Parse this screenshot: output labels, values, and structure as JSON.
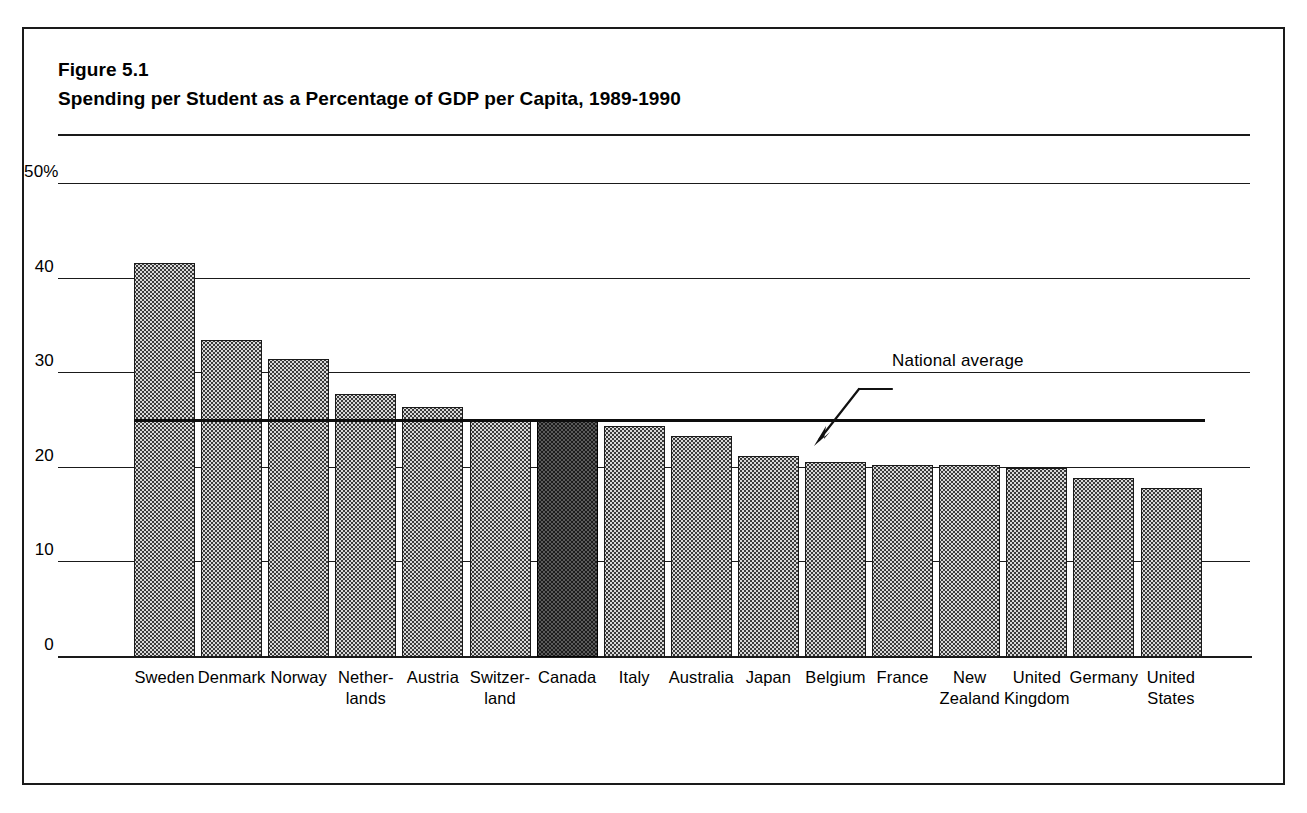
{
  "figure": {
    "number": "Figure 5.1",
    "title": "Spending per Student as a Percentage of GDP per Capita, 1989-1990"
  },
  "annotation": {
    "label": "National average"
  },
  "chart_data": {
    "type": "bar",
    "title": "Spending per Student as a Percentage of GDP per Capita, 1989-1990",
    "xlabel": "",
    "ylabel": "",
    "ylim": [
      0,
      50
    ],
    "yticks": [
      "0",
      "10",
      "20",
      "30",
      "40",
      "50%"
    ],
    "ytick_values": [
      0,
      10,
      20,
      30,
      40,
      50
    ],
    "grid": true,
    "legend": false,
    "categories": [
      "Sweden",
      "Denmark",
      "Norway",
      "Nether-\nlands",
      "Austria",
      "Switzer-\nland",
      "Canada",
      "Italy",
      "Australia",
      "Japan",
      "Belgium",
      "France",
      "New\nZealand",
      "United\nKingdom",
      "Germany",
      "United\nStates"
    ],
    "category_lines": [
      [
        "Sweden"
      ],
      [
        "Denmark"
      ],
      [
        "Norway"
      ],
      [
        "Nether-",
        "lands"
      ],
      [
        "Austria"
      ],
      [
        "Switzer-",
        "land"
      ],
      [
        "Canada"
      ],
      [
        "Italy"
      ],
      [
        "Australia"
      ],
      [
        "Japan"
      ],
      [
        "Belgium"
      ],
      [
        "France"
      ],
      [
        "New",
        "Zealand"
      ],
      [
        "United",
        "Kingdom"
      ],
      [
        "Germany"
      ],
      [
        "United",
        "States"
      ]
    ],
    "values": [
      41.7,
      33.5,
      31.5,
      27.8,
      26.4,
      24.9,
      25.0,
      24.4,
      23.4,
      21.2,
      20.6,
      20.3,
      20.3,
      20.0,
      18.9,
      17.9
    ],
    "highlight_category": "Canada",
    "highlight_color": "#1c1c1c",
    "bar_color": "#d8d8d8",
    "annotations": [
      {
        "text": "National average",
        "type": "reference-line-label",
        "value": 25.0
      }
    ],
    "reference_line": {
      "label": "National average",
      "value": 25.0
    }
  }
}
